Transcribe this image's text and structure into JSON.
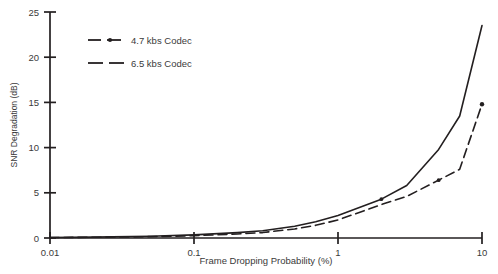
{
  "chart_data": {
    "type": "line",
    "title": "",
    "xlabel": "Frame Dropping Probability (%)",
    "ylabel": "SNR Degradation (dB)",
    "xscale": "log",
    "yscale": "linear",
    "xlim": [
      0.01,
      10
    ],
    "ylim": [
      0,
      25
    ],
    "xticks": [
      0.01,
      0.1,
      1,
      10
    ],
    "xtick_labels": [
      "0.01",
      "0.1",
      "1",
      "10"
    ],
    "yticks": [
      0,
      5,
      10,
      15,
      20,
      25
    ],
    "ytick_labels": [
      "0",
      "5",
      "10",
      "15",
      "20",
      "25"
    ],
    "grid": false,
    "legend_position": "upper-left-inside",
    "series": [
      {
        "name": "4.7 kbs Codec",
        "style": "solid",
        "color": "#231f20",
        "x": [
          0.01,
          0.02,
          0.05,
          0.1,
          0.2,
          0.3,
          0.5,
          0.7,
          1.0,
          2.0,
          3.0,
          5.0,
          7.0,
          10.0
        ],
        "values": [
          0.05,
          0.1,
          0.2,
          0.35,
          0.6,
          0.8,
          1.3,
          1.8,
          2.5,
          4.3,
          5.8,
          9.8,
          13.5,
          23.5
        ]
      },
      {
        "name": "6.5 kbs Codec",
        "style": "dashed",
        "color": "#231f20",
        "x": [
          0.01,
          0.02,
          0.05,
          0.1,
          0.2,
          0.3,
          0.5,
          0.7,
          1.0,
          2.0,
          3.0,
          5.0,
          7.0,
          10.0
        ],
        "values": [
          0.05,
          0.08,
          0.15,
          0.25,
          0.45,
          0.6,
          1.0,
          1.4,
          2.0,
          3.7,
          4.6,
          6.4,
          7.6,
          14.8
        ]
      }
    ]
  },
  "legend": {
    "entries": [
      {
        "label": "4.7 kbs Codec",
        "marker": "dash-dot-dash"
      },
      {
        "label": "6.5 kbs Codec",
        "marker": "dash-dash"
      }
    ]
  }
}
